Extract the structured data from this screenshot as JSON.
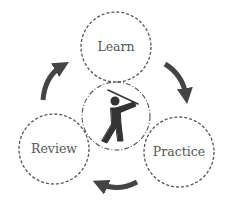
{
  "diagram": {
    "type": "cycle",
    "center_icon": "golfer-icon",
    "nodes": [
      {
        "id": "learn",
        "label": "Learn"
      },
      {
        "id": "practice",
        "label": "Practice"
      },
      {
        "id": "review",
        "label": "Review"
      }
    ],
    "edges": [
      {
        "from": "learn",
        "to": "practice",
        "direction": "clockwise"
      },
      {
        "from": "practice",
        "to": "review",
        "direction": "clockwise"
      },
      {
        "from": "review",
        "to": "learn",
        "direction": "clockwise"
      }
    ],
    "colors": {
      "stroke": "#555555",
      "arrow": "#444444",
      "text": "#555555",
      "icon": "#333333"
    }
  }
}
